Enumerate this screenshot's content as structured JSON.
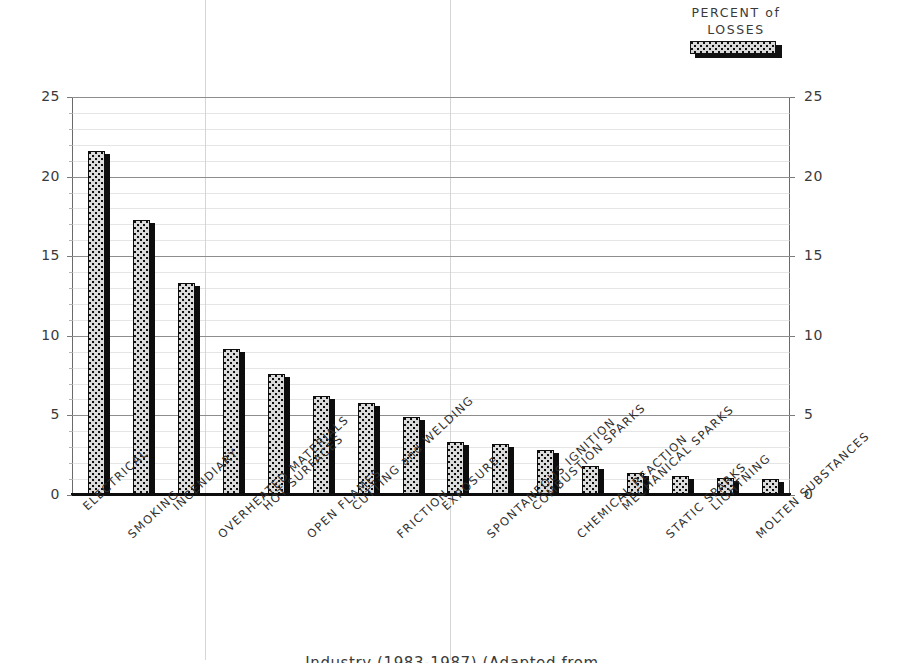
{
  "legend": {
    "line1": "PERCENT of",
    "line2": "LOSSES",
    "swatch_name": "percent-of-losses-swatch",
    "swatch_fill": "#dcdcdc",
    "swatch_outline": "#0d0d0d"
  },
  "axes": {
    "left_ticks": [
      "25",
      "20",
      "15",
      "10",
      "5",
      "0"
    ],
    "right_ticks": [
      "25",
      "20",
      "15",
      "10",
      "5",
      "0"
    ],
    "y_min": 0,
    "y_max": 25,
    "y_step": 5
  },
  "caption": {
    "visible_sliver": "Industry (1983-1987)  (Adapted from"
  },
  "chart_data": {
    "type": "bar",
    "title": "",
    "subtitle": "",
    "xlabel": "",
    "ylabel": "",
    "ylim": [
      0,
      25
    ],
    "yticks": [
      0,
      5,
      10,
      15,
      20,
      25
    ],
    "grid": true,
    "legend_position": "top-right",
    "legend_entries": [
      "PERCENT of LOSSES"
    ],
    "categories": [
      "ELECTRICAL",
      "SMOKING",
      "INCENDIARY",
      "OVERHEATED MATERIALS",
      "HOT SURFACES",
      "OPEN FLAMES",
      "CUTTING and WELDING",
      "FRICTION",
      "EXPOSURE",
      "SPONTANEOUS IGNITION",
      "COMBUSTION SPARKS",
      "CHEMICAL REACTION",
      "MECHANICAL SPARKS",
      "STATIC SPARKS",
      "LIGHTNING",
      "MOLTEN SUBSTANCES"
    ],
    "values": [
      21.6,
      17.3,
      13.3,
      9.2,
      7.6,
      6.2,
      5.8,
      4.9,
      3.3,
      3.2,
      2.8,
      1.8,
      1.4,
      1.2,
      1.1,
      1.0
    ],
    "series": [
      {
        "name": "PERCENT of LOSSES",
        "values": [
          21.6,
          17.3,
          13.3,
          9.2,
          7.6,
          6.2,
          5.8,
          4.9,
          3.3,
          3.2,
          2.8,
          1.8,
          1.4,
          1.2,
          1.1,
          1.0
        ]
      }
    ]
  }
}
